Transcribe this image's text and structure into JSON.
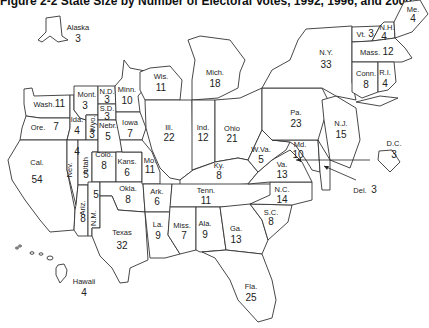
{
  "title": "Figure 2-2   State Size by Number of Electoral Votes, 1992, 1996, and 2000",
  "states": [
    {
      "abbr": "Alaska",
      "votes": 3
    },
    {
      "abbr": "Hawaii",
      "votes": 4
    },
    {
      "abbr": "Wash.",
      "votes": 11
    },
    {
      "abbr": "Ore.",
      "votes": 7
    },
    {
      "abbr": "Cal.",
      "votes": 54
    },
    {
      "abbr": "Ida.",
      "votes": 4
    },
    {
      "abbr": "Nev.",
      "votes": 4
    },
    {
      "abbr": "Mont.",
      "votes": 3
    },
    {
      "abbr": "Wyo.",
      "votes": 3
    },
    {
      "abbr": "Utah",
      "votes": 5
    },
    {
      "abbr": "Ariz.",
      "votes": 8
    },
    {
      "abbr": "Colo.",
      "votes": 8
    },
    {
      "abbr": "N.M.",
      "votes": 5
    },
    {
      "abbr": "N.D.",
      "votes": 3
    },
    {
      "abbr": "S.D.",
      "votes": 3
    },
    {
      "abbr": "Nebr.",
      "votes": 5
    },
    {
      "abbr": "Kans.",
      "votes": 6
    },
    {
      "abbr": "Okla.",
      "votes": 8
    },
    {
      "abbr": "Texas",
      "votes": 32
    },
    {
      "abbr": "Minn.",
      "votes": 10
    },
    {
      "abbr": "Iowa",
      "votes": 7
    },
    {
      "abbr": "Mo.",
      "votes": 11
    },
    {
      "abbr": "Ark.",
      "votes": 6
    },
    {
      "abbr": "La.",
      "votes": 9
    },
    {
      "abbr": "Wis.",
      "votes": 11
    },
    {
      "abbr": "Ill.",
      "votes": 22
    },
    {
      "abbr": "Mich.",
      "votes": 18
    },
    {
      "abbr": "Ind.",
      "votes": 12
    },
    {
      "abbr": "Ohio",
      "votes": 21
    },
    {
      "abbr": "Ky.",
      "votes": 8
    },
    {
      "abbr": "Tenn.",
      "votes": 11
    },
    {
      "abbr": "Miss.",
      "votes": 7
    },
    {
      "abbr": "Ala.",
      "votes": 9
    },
    {
      "abbr": "Ga.",
      "votes": 13
    },
    {
      "abbr": "Fla.",
      "votes": 25
    },
    {
      "abbr": "S.C.",
      "votes": 8
    },
    {
      "abbr": "N.C.",
      "votes": 14
    },
    {
      "abbr": "Va.",
      "votes": 13
    },
    {
      "abbr": "W.Va.",
      "votes": 5
    },
    {
      "abbr": "Md.",
      "votes": 10
    },
    {
      "abbr": "Del.",
      "votes": 3
    },
    {
      "abbr": "D.C.",
      "votes": 3
    },
    {
      "abbr": "Pa.",
      "votes": 23
    },
    {
      "abbr": "N.J.",
      "votes": 15
    },
    {
      "abbr": "N.Y.",
      "votes": 33
    },
    {
      "abbr": "Conn.",
      "votes": 8
    },
    {
      "abbr": "R.I.",
      "votes": 4
    },
    {
      "abbr": "Mass.",
      "votes": 12
    },
    {
      "abbr": "Vt.",
      "votes": 3
    },
    {
      "abbr": "N.H.",
      "votes": 4
    },
    {
      "abbr": "Me.",
      "votes": 4
    }
  ]
}
